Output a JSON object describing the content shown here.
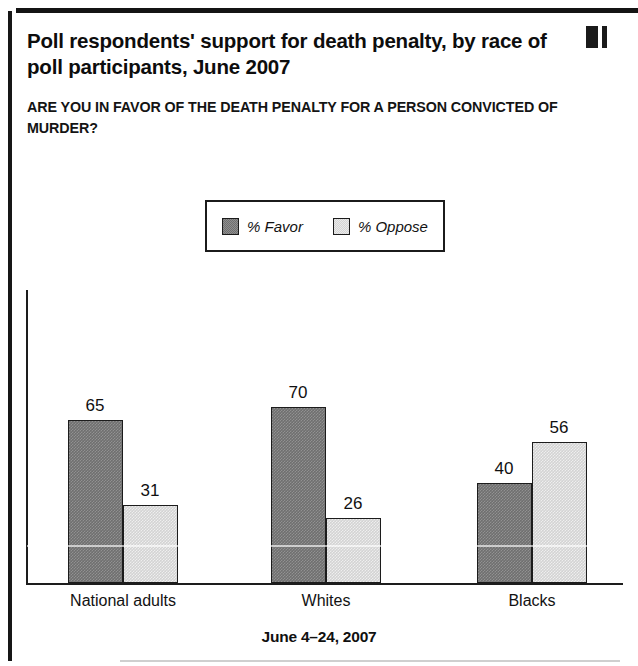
{
  "title": "Poll respondents' support for death penalty, by race of poll participants, June 2007",
  "subtitle": "ARE YOU IN FAVOR OF THE DEATH PENALTY FOR A PERSON CONVICTED OF MURDER?",
  "footer_caption": "June 4–24, 2007",
  "legend": {
    "entries": [
      {
        "label": "% Favor",
        "color": "#6f6f6f",
        "key": "favor"
      },
      {
        "label": "% Oppose",
        "color": "#d3d3d3",
        "key": "oppose"
      }
    ]
  },
  "chart_data": {
    "type": "bar",
    "title": "Poll respondents' support for death penalty, by race of poll participants, June 2007",
    "subtitle": "ARE YOU IN FAVOR OF THE DEATH PENALTY FOR A PERSON CONVICTED OF MURDER?",
    "xlabel": "June 4–24, 2007",
    "ylabel": "",
    "categories": [
      "National adults",
      "Whites",
      "Blacks"
    ],
    "series": [
      {
        "name": "% Favor",
        "color": "#6f6f6f",
        "values": [
          65,
          70,
          40
        ]
      },
      {
        "name": "% Oppose",
        "color": "#d3d3d3",
        "values": [
          31,
          26,
          56
        ]
      }
    ],
    "ylim": [
      0,
      100
    ],
    "grid": false,
    "legend_position": "top-center",
    "value_labels": true
  }
}
